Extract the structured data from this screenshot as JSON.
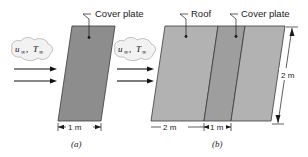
{
  "figure": {
    "background_color": "#ffffff",
    "panels": [
      {
        "caption": "(a)",
        "labels": {
          "cover_plate": "Cover plate"
        },
        "flow": {
          "velocity_symbol": "u",
          "velocity_subscript": "∞",
          "separator": ", ",
          "temperature_symbol": "T",
          "temperature_subscript": "∞",
          "arrow_count": 2
        },
        "dimensions": [
          {
            "name": "width",
            "value": "1 m",
            "orientation": "horizontal"
          }
        ],
        "plate_fill": "#8d8d8d"
      },
      {
        "caption": "(b)",
        "labels": {
          "roof": "Roof",
          "cover_plate": "Cover plate"
        },
        "flow": {
          "velocity_symbol": "u",
          "velocity_subscript": "∞",
          "separator": ", ",
          "temperature_symbol": "T",
          "temperature_subscript": "∞",
          "arrow_count": 2
        },
        "dimensions": [
          {
            "name": "roof-width",
            "value": "2 m",
            "orientation": "horizontal"
          },
          {
            "name": "cover-plate-width",
            "value": "1 m",
            "orientation": "horizontal"
          },
          {
            "name": "height",
            "value": "2 m",
            "orientation": "vertical"
          }
        ],
        "segment_fills": [
          "#b2b2b2",
          "#9e9e9e",
          "#b2b2b2"
        ]
      }
    ]
  }
}
